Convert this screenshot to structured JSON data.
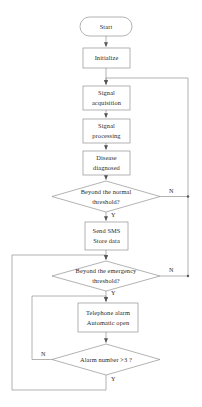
{
  "diagram": {
    "stroke_color": "#7a7a7a",
    "text_color": "#2b2b2b",
    "background": "#ffffff",
    "nodes": [
      {
        "id": "start",
        "shape": "terminator",
        "lines": [
          "Start"
        ]
      },
      {
        "id": "initialize",
        "shape": "process",
        "lines": [
          "Initialize"
        ]
      },
      {
        "id": "signal-acquisition",
        "shape": "process",
        "lines": [
          "Signal",
          "acquisition"
        ]
      },
      {
        "id": "signal-processing",
        "shape": "process",
        "lines": [
          "Signal",
          "processing"
        ]
      },
      {
        "id": "disease-diagnosed",
        "shape": "process",
        "lines": [
          "Disease",
          "diagnosed"
        ]
      },
      {
        "id": "normal-threshold",
        "shape": "decision",
        "lines": [
          "Beyond the normal",
          "threshold?"
        ]
      },
      {
        "id": "send-sms",
        "shape": "process",
        "lines": [
          "Send SMS",
          "Store data"
        ]
      },
      {
        "id": "emergency-threshold",
        "shape": "decision",
        "lines": [
          "Beyond the emergency",
          "threshold?"
        ]
      },
      {
        "id": "telephone-alarm",
        "shape": "process",
        "lines": [
          "Telephone alarm",
          "Automatic open"
        ]
      },
      {
        "id": "alarm-number",
        "shape": "decision",
        "lines": [
          "Alarm number >3 ?"
        ]
      }
    ],
    "branch_labels": {
      "normal_no": "N",
      "normal_yes": "Y",
      "emergency_no": "N",
      "emergency_yes": "Y",
      "alarm_no": "N",
      "alarm_yes": "Y"
    },
    "node_text": {
      "start_line1": "Start",
      "initialize_line1": "Initialize",
      "acquisition_line1": "Signal",
      "acquisition_line2": "acquisition",
      "processing_line1": "Signal",
      "processing_line2": "processing",
      "diagnosed_line1": "Disease",
      "diagnosed_line2": "diagnosed",
      "normal_line1": "Beyond the normal",
      "normal_line2": "threshold?",
      "sms_line1": "Send SMS",
      "sms_line2": "Store data",
      "emergency_line1": "Beyond the emergency",
      "emergency_line2": "threshold?",
      "alarm_line1": "Telephone alarm",
      "alarm_line2": "Automatic open",
      "alarmnum_line1": "Alarm number >3 ?"
    }
  }
}
